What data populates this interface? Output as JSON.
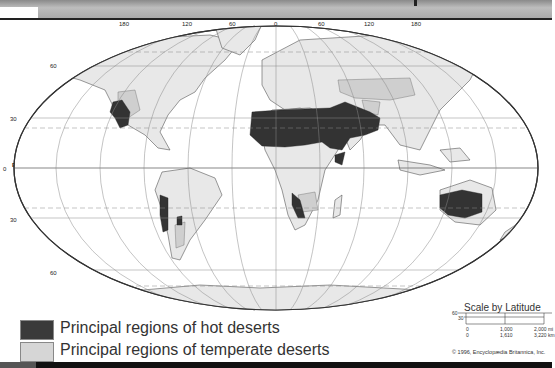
{
  "map": {
    "title": "World distribution of hot and temperate deserts",
    "longitude_labels": [
      "180",
      "120",
      "60",
      "0",
      "60",
      "120",
      "180"
    ],
    "latitude_labels": {
      "north_60": "60",
      "north_30": "30",
      "equator_value": "0",
      "equator_label": "Equator",
      "south_30": "30",
      "south_60": "60"
    },
    "colors": {
      "ocean": "#ffffff",
      "land": "#e6e6e6",
      "temperate_desert": "#cfcfcf",
      "hot_desert": "#333333",
      "outline": "#444444",
      "grid": "#888888"
    }
  },
  "legend": {
    "items": [
      {
        "label": "Principal regions of hot deserts",
        "color": "#3a3a3a"
      },
      {
        "label": "Principal regions of temperate deserts",
        "color": "#d6d6d6"
      }
    ]
  },
  "scale": {
    "title": "Scale by Latitude",
    "lat_60": "60",
    "lat_30": "30",
    "row_miles": [
      "0",
      "1,000",
      "2,000 mi"
    ],
    "row_km": [
      "0",
      "1,610",
      "3,220 km"
    ]
  },
  "copyright": "© 1996, Encyclopædia Britannica, Inc."
}
